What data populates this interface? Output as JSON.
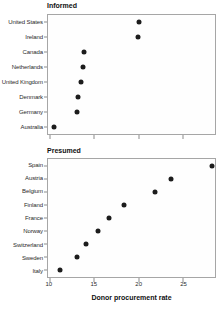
{
  "chart_data": {
    "type": "scatter",
    "subtype": "dot-plot",
    "xlabel": "Donor procurement rate",
    "xlim": [
      9.8,
      28.6
    ],
    "xticks": [
      10,
      15,
      20,
      25
    ],
    "grid": false,
    "legend": "none",
    "dot_color": "#1c1c1c",
    "border_color": "#a6a6a6",
    "panels": [
      {
        "title": "Informed",
        "categories": [
          "United States",
          "Ireland",
          "Canada",
          "Netherlands",
          "United Kingdom",
          "Denmark",
          "Germany",
          "Australia"
        ],
        "values": [
          20.1,
          19.9,
          13.9,
          13.7,
          13.5,
          13.2,
          13.1,
          10.5
        ]
      },
      {
        "title": "Presumed",
        "categories": [
          "Spain",
          "Austria",
          "Belgium",
          "Finland",
          "France",
          "Norway",
          "Switzerland",
          "Sweden",
          "Italy"
        ],
        "values": [
          28.3,
          23.6,
          21.9,
          18.4,
          16.7,
          15.4,
          14.1,
          13.1,
          11.1
        ]
      }
    ]
  }
}
